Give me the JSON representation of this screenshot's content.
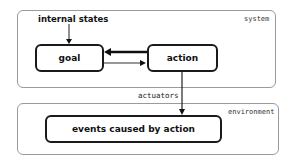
{
  "diagram": {
    "regions": {
      "system": {
        "label": "system"
      },
      "environment": {
        "label": "environment"
      }
    },
    "inputs": {
      "internal_states": "internal states"
    },
    "nodes": {
      "goal": "goal",
      "action": "action",
      "events": "events caused by action"
    },
    "edges": {
      "actuators": "actuators"
    },
    "colors": {
      "node_border": "#1a1a1a",
      "region_border": "#9a9a9a",
      "background": "#ffffff"
    }
  }
}
